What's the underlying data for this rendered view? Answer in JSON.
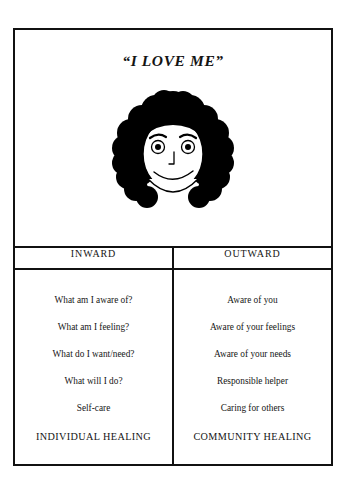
{
  "poster": {
    "title": "“I LOVE ME”",
    "illustration": {
      "name": "smiling-face-with-curly-hair-illustration",
      "description": "Line drawing of a smiling face with large curly black hair"
    }
  },
  "table": {
    "headers": [
      "INWARD",
      "OUTWARD"
    ],
    "inward": {
      "entries": [
        "What am I aware of?",
        "What am I feeling?",
        "What do I want/need?",
        "What will I do?",
        "Self-care"
      ],
      "summary": "INDIVIDUAL HEALING"
    },
    "outward": {
      "entries": [
        "Aware of you",
        "Aware of your feelings",
        "Aware of your needs",
        "Responsible helper",
        "Caring for others"
      ],
      "summary": "COMMUNITY HEALING"
    }
  },
  "colors": {
    "ink": "#111111",
    "paper": "#ffffff",
    "hair": "#000000"
  }
}
